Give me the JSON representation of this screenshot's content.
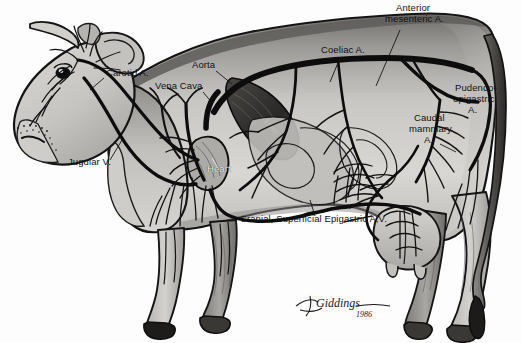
{
  "figure": {
    "medium": "pen-and-ink shaded illustration",
    "background_color": "#fdfdfd",
    "body_fill_light": "#d8d6d2",
    "body_fill_mid": "#b2b0ac",
    "body_fill_dark": "#6f6d6a",
    "vessel_color": "#111111",
    "label_color": "#111111"
  },
  "labels": [
    {
      "id": "carotid",
      "text": "Carotid A.",
      "x": 106,
      "y": 74,
      "white": false,
      "align": "left"
    },
    {
      "id": "vena-cava",
      "text": "Vena Cava",
      "x": 155,
      "y": 87,
      "white": false,
      "align": "left"
    },
    {
      "id": "aorta",
      "text": "Aorta",
      "x": 192,
      "y": 66,
      "white": false,
      "align": "left"
    },
    {
      "id": "jugular",
      "text": "Jugular V.",
      "x": 68,
      "y": 163,
      "white": false,
      "align": "left"
    },
    {
      "id": "heart",
      "text": "Heart",
      "x": 207,
      "y": 170,
      "white": true,
      "align": "left"
    },
    {
      "id": "coeliac",
      "text": "Coeliac A.",
      "x": 321,
      "y": 51,
      "white": false,
      "align": "left"
    },
    {
      "id": "ant-mes-1",
      "text": "Anterior",
      "x": 396,
      "y": 8,
      "white": false,
      "align": "left"
    },
    {
      "id": "ant-mes-2",
      "text": "mesenteric A.",
      "x": 385,
      "y": 19,
      "white": false,
      "align": "left"
    },
    {
      "id": "pud-1",
      "text": "Pudendo-",
      "x": 455,
      "y": 88,
      "white": false,
      "align": "left"
    },
    {
      "id": "pud-2",
      "text": "epigastric",
      "x": 453,
      "y": 99,
      "white": false,
      "align": "left"
    },
    {
      "id": "pud-3",
      "text": "A.",
      "x": 468,
      "y": 110,
      "white": false,
      "align": "left"
    },
    {
      "id": "caud-1",
      "text": "Caudal",
      "x": 414,
      "y": 118,
      "white": false,
      "align": "left"
    },
    {
      "id": "caud-2",
      "text": "mammary",
      "x": 409,
      "y": 129,
      "white": false,
      "align": "left"
    },
    {
      "id": "caud-3",
      "text": "A.",
      "x": 424,
      "y": 140,
      "white": false,
      "align": "left"
    },
    {
      "id": "cranial-epigastric",
      "text": "Cranial, Superficial Epigastric A,V.",
      "x": 240,
      "y": 219,
      "white": false,
      "align": "left"
    }
  ],
  "signature": {
    "name": "Giddings",
    "year": "1986"
  },
  "anatomy_notes": {
    "organ_liver": "Liver",
    "organ_heart": "Heart"
  }
}
